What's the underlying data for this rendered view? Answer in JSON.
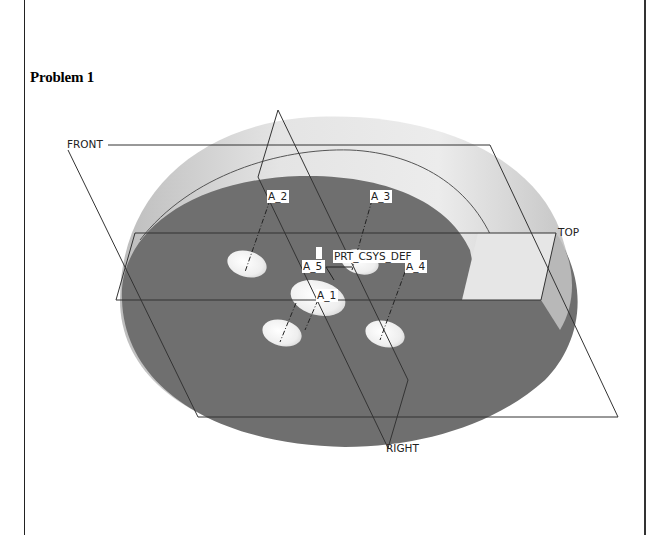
{
  "document": {
    "heading": "Problem 1"
  },
  "model_view": {
    "datum_planes": [
      "FRONT",
      "TOP",
      "RIGHT"
    ],
    "axes": [
      "A_1",
      "A_2",
      "A_3",
      "A_4",
      "A_5"
    ],
    "coordinate_system": "PRT_CSYS_DEF",
    "colors": {
      "face_dark": "#6f6f6f",
      "rim_light": "#e2e2e2",
      "hole_light": "#f3f3f3",
      "datum_line": "#333333"
    }
  }
}
